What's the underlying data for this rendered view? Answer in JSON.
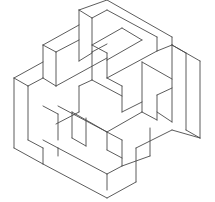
{
  "figure": {
    "stroke_color": "#4a4a4a",
    "background_color": "#ffffff",
    "width": 215,
    "height": 202,
    "lines": [
      [
        79,
        10,
        107,
        0
      ],
      [
        107,
        0,
        172,
        37
      ],
      [
        172,
        37,
        172,
        45
      ],
      [
        79,
        10,
        79,
        61
      ],
      [
        79,
        10,
        92,
        18
      ],
      [
        92,
        18,
        92,
        52
      ],
      [
        92,
        18,
        107,
        10
      ],
      [
        107,
        10,
        157,
        37
      ],
      [
        157,
        37,
        157,
        51
      ],
      [
        157,
        51,
        172,
        45
      ],
      [
        157,
        51,
        107,
        78
      ],
      [
        107,
        78,
        107,
        60
      ],
      [
        107,
        60,
        142,
        40
      ],
      [
        142,
        40,
        122,
        28
      ],
      [
        122,
        28,
        92,
        45
      ],
      [
        92,
        45,
        107,
        53
      ],
      [
        107,
        53,
        107,
        60
      ],
      [
        79,
        61,
        92,
        53
      ],
      [
        92,
        52,
        107,
        44
      ],
      [
        43,
        45,
        79,
        25
      ],
      [
        43,
        45,
        43,
        78
      ],
      [
        43,
        78,
        56,
        86
      ],
      [
        56,
        86,
        56,
        52
      ],
      [
        56,
        52,
        79,
        40
      ],
      [
        43,
        45,
        56,
        52
      ],
      [
        56,
        86,
        107,
        58
      ],
      [
        172,
        45,
        200,
        61
      ],
      [
        200,
        61,
        200,
        138
      ],
      [
        172,
        45,
        172,
        122
      ],
      [
        186,
        53,
        186,
        130
      ],
      [
        172,
        45,
        186,
        53
      ],
      [
        186,
        130,
        200,
        138
      ],
      [
        157,
        112,
        172,
        122
      ],
      [
        142,
        62,
        172,
        79
      ],
      [
        142,
        62,
        142,
        112
      ],
      [
        142,
        112,
        157,
        120
      ],
      [
        157,
        120,
        157,
        95
      ],
      [
        157,
        95,
        172,
        88
      ],
      [
        14,
        78,
        43,
        62
      ],
      [
        14,
        78,
        14,
        148
      ],
      [
        14,
        148,
        43,
        164
      ],
      [
        28,
        86,
        28,
        140
      ],
      [
        14,
        78,
        28,
        86
      ],
      [
        28,
        86,
        43,
        78
      ],
      [
        28,
        140,
        43,
        148
      ],
      [
        43,
        148,
        43,
        164
      ],
      [
        43,
        106,
        58,
        114
      ],
      [
        58,
        114,
        58,
        140
      ],
      [
        43,
        140,
        58,
        148
      ],
      [
        43,
        164,
        107,
        198
      ],
      [
        107,
        198,
        136,
        182
      ],
      [
        58,
        148,
        107,
        174
      ],
      [
        107,
        174,
        107,
        190
      ],
      [
        58,
        156,
        58,
        148
      ],
      [
        107,
        174,
        122,
        166
      ],
      [
        122,
        166,
        122,
        140
      ],
      [
        122,
        140,
        58,
        106
      ],
      [
        136,
        182,
        136,
        148
      ],
      [
        136,
        148,
        172,
        130
      ],
      [
        150,
        156,
        150,
        128
      ],
      [
        122,
        166,
        150,
        156
      ],
      [
        172,
        130,
        200,
        138
      ],
      [
        142,
        112,
        107,
        132
      ],
      [
        107,
        132,
        107,
        150
      ],
      [
        107,
        150,
        122,
        158
      ],
      [
        72,
        112,
        107,
        132
      ],
      [
        72,
        112,
        72,
        138
      ],
      [
        72,
        138,
        86,
        146
      ],
      [
        86,
        146,
        86,
        118
      ],
      [
        92,
        52,
        92,
        80
      ],
      [
        107,
        78,
        122,
        86
      ],
      [
        122,
        86,
        122,
        112
      ],
      [
        122,
        112,
        142,
        102
      ],
      [
        79,
        86,
        92,
        80
      ],
      [
        79,
        86,
        79,
        112
      ],
      [
        79,
        112,
        56,
        124
      ],
      [
        92,
        80,
        122,
        96
      ]
    ]
  }
}
